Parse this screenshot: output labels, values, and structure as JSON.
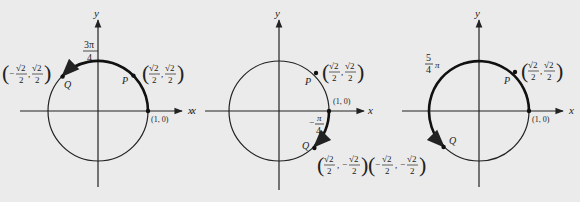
{
  "panels": [
    {
      "id": "left",
      "axis_x": "x",
      "axis_y": "y",
      "angle_label": {
        "num": "3π",
        "den": "4"
      },
      "point_p": {
        "label": "P",
        "coord": [
          "√2",
          "2",
          "√2",
          "2"
        ],
        "sign": [
          "",
          ""
        ]
      },
      "point_q": {
        "label": "Q",
        "coord": [
          "√2",
          "2",
          "√2",
          "2"
        ],
        "sign": [
          "−",
          ""
        ]
      },
      "one_zero": "(1, 0)"
    },
    {
      "id": "middle",
      "axis_x": "x",
      "axis_y": "y",
      "angle_label": {
        "num": "π",
        "den": "4",
        "sign": "−"
      },
      "point_p": {
        "label": "P",
        "coord": [
          "√2",
          "2",
          "√2",
          "2"
        ],
        "sign": [
          "",
          ""
        ]
      },
      "point_q": {
        "label": "Q",
        "coord": [
          "√2",
          "2",
          "√2",
          "2"
        ],
        "sign": [
          "",
          "−"
        ]
      },
      "one_zero": "(1, 0)"
    },
    {
      "id": "right",
      "axis_x": "x",
      "axis_y": "y",
      "angle_label": {
        "num": "5",
        "den": "4",
        "suffix": "π"
      },
      "point_p": {
        "label": "P",
        "coord": [
          "√2",
          "2",
          "√2",
          "2"
        ],
        "sign": [
          "",
          ""
        ]
      },
      "point_q": {
        "label": "Q",
        "coord": [
          "√2",
          "2",
          "√2",
          "2"
        ],
        "sign": [
          "−",
          "−"
        ]
      },
      "one_zero": "(1, 0)"
    }
  ],
  "labels": {
    "x": "x",
    "y": "y",
    "P": "P",
    "Q": "Q",
    "one_zero": "(1, 0)",
    "sqrt2": "√2",
    "two": "2",
    "four": "4",
    "three_pi": "3π",
    "pi": "π",
    "five": "5",
    "minus": "−",
    "comma": ","
  }
}
